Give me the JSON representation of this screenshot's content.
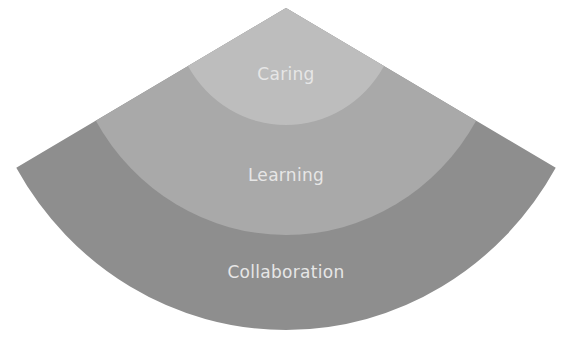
{
  "diagram": {
    "type": "concentric-sector",
    "apex": {
      "x": 286,
      "y": 8
    },
    "corner_slope": {
      "dx": 270,
      "dy": 160
    },
    "x_scale": 0.965,
    "label_color": "#e6e6e6",
    "bands": [
      {
        "label": "Caring",
        "ry": 117,
        "color": "#bdbdbd",
        "label_y": 66
      },
      {
        "label": "Learning",
        "ry": 227,
        "color": "#a9a9a9",
        "label_y": 167
      },
      {
        "label": "Collaboration",
        "ry": 322,
        "color": "#8e8e8e",
        "label_y": 264
      }
    ]
  }
}
